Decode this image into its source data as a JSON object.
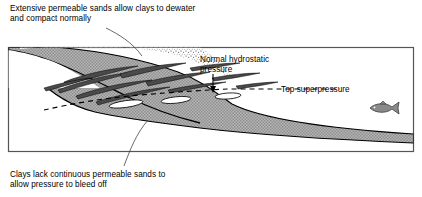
{
  "figure": {
    "type": "geological-cross-section",
    "background_color": "#ffffff",
    "line_color": "#000000"
  },
  "annotations": {
    "top_left": {
      "name": "extensive-permeable-sands-note",
      "line1": "Extensive permeable sands allow clays to dewater",
      "line2": "and compact normally",
      "text": "Extensive permeable sands allow clays to dewater\nand compact normally",
      "leader": "curve-down-right-into-sand-wedge"
    },
    "hydrostatic": {
      "name": "normal-hydrostatic-pressure-label",
      "line1": "Normal hydrostatic",
      "line2": "pressure",
      "text": "Normal hydrostatic\npressure",
      "leader": "down-arrow-to-clay-top"
    },
    "superpressure": {
      "name": "top-superpressure-label",
      "text": "Top superpressure",
      "leader": "dashed-line-left"
    },
    "bottom_left": {
      "name": "clays-lack-permeable-sands-note",
      "line1": "Clays lack continuous permeable sands to",
      "line2": "allow pressure to bleed off",
      "text": "Clays lack continuous permeable sands to\nallow pressure to bleed off",
      "leader": "curve-up-right-into-clay-body"
    }
  },
  "units": [
    {
      "name": "permeable-sand-wedge",
      "pattern": "stipple",
      "fill_color": "#ffffff",
      "description": "Extensive permeable sand, stippled, upper left wedge"
    },
    {
      "name": "clay-body",
      "pattern": "halftone-gray",
      "fill_color": "#a9a9a9",
      "description": "Thick clay body thinning basinward to the right"
    },
    {
      "name": "sand-stringers",
      "pattern": "solid-dark",
      "fill_color": "#4a4a4a",
      "count": 11,
      "description": "Discontinuous dark sand lenses interfingering within upper clay"
    },
    {
      "name": "isolated-sand-lenses",
      "pattern": "white-outline",
      "fill_color": "#ffffff",
      "count": 3,
      "description": "Isolated white sand lenses below top superpressure surface"
    }
  ],
  "markers": {
    "top_superpressure_line": {
      "name": "top-superpressure-surface",
      "style": "dashed",
      "dash_pattern": "5 4",
      "color": "#000000"
    },
    "fish": {
      "name": "fish-icon",
      "fill_color": "#8a8a8a",
      "facing": "left",
      "description": "Small fish symbol indicating open marine water"
    },
    "frame": {
      "name": "diagram-frame",
      "color": "#555555",
      "rect": [
        8,
        47,
        406,
        152
      ]
    }
  },
  "colors": {
    "gray_clay": "#a9a9a9",
    "dark_sand": "#4a4a4a",
    "fish": "#8a8a8a",
    "frame": "#555555",
    "text": "#000000"
  }
}
